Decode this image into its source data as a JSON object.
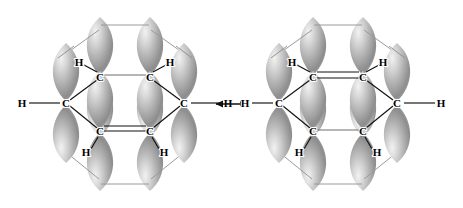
{
  "figure": {
    "background_color": "#ffffff",
    "ink_color": "#000000",
    "lobe_color_dark": "#8e8e8e",
    "lobe_color_mid": "#a8a8a8",
    "lobe_color_light": "#e2e2e2",
    "thin_bond_color": "#9a9a9a"
  },
  "resonance_arrow": {
    "symbol": "double-headed-arrow",
    "glyph": "↔",
    "label": "resonance"
  },
  "structures": [
    {
      "id": "kekule-left",
      "name": "Kekule structure A",
      "double_bond_positions": [
        "bottom",
        "upper-left",
        "upper-right"
      ],
      "single_bond_positions": [
        "top",
        "lower-left",
        "lower-right"
      ],
      "atoms": [
        {
          "id": "c1",
          "element": "C",
          "label": "C",
          "x": 66,
          "y": 103,
          "position": "left-vertex"
        },
        {
          "id": "c2",
          "element": "C",
          "label": "C",
          "x": 100,
          "y": 77,
          "position": "upper-left-vertex"
        },
        {
          "id": "c3",
          "element": "C",
          "label": "C",
          "x": 150,
          "y": 77,
          "position": "upper-right-vertex"
        },
        {
          "id": "c4",
          "element": "C",
          "label": "C",
          "x": 184,
          "y": 103,
          "position": "right-vertex"
        },
        {
          "id": "c5",
          "element": "C",
          "label": "C",
          "x": 150,
          "y": 131,
          "position": "lower-right-vertex"
        },
        {
          "id": "c6",
          "element": "C",
          "label": "C",
          "x": 100,
          "y": 131,
          "position": "lower-left-vertex"
        },
        {
          "id": "h1",
          "element": "H",
          "label": "H",
          "x": 22,
          "y": 103,
          "position": "left-outer"
        },
        {
          "id": "h2",
          "element": "H",
          "label": "H",
          "x": 79,
          "y": 62,
          "position": "upper-left-inner"
        },
        {
          "id": "h3",
          "element": "H",
          "label": "H",
          "x": 170,
          "y": 62,
          "position": "upper-right-inner"
        },
        {
          "id": "h4",
          "element": "H",
          "label": "H",
          "x": 228,
          "y": 103,
          "position": "right-outer"
        },
        {
          "id": "h5",
          "element": "H",
          "label": "H",
          "x": 86,
          "y": 152,
          "position": "lower-left-inner"
        },
        {
          "id": "h6",
          "element": "H",
          "label": "H",
          "x": 164,
          "y": 152,
          "position": "lower-right-inner"
        }
      ]
    },
    {
      "id": "kekule-right",
      "name": "Kekule structure B",
      "double_bond_positions": [
        "top",
        "lower-left",
        "lower-right"
      ],
      "single_bond_positions": [
        "bottom",
        "upper-left",
        "upper-right"
      ],
      "atoms": [
        {
          "id": "c1",
          "element": "C",
          "label": "C",
          "x": 279,
          "y": 103,
          "position": "left-vertex"
        },
        {
          "id": "c2",
          "element": "C",
          "label": "C",
          "x": 313,
          "y": 77,
          "position": "upper-left-vertex"
        },
        {
          "id": "c3",
          "element": "C",
          "label": "C",
          "x": 363,
          "y": 77,
          "position": "upper-right-vertex"
        },
        {
          "id": "c4",
          "element": "C",
          "label": "C",
          "x": 397,
          "y": 103,
          "position": "right-vertex"
        },
        {
          "id": "c5",
          "element": "C",
          "label": "C",
          "x": 363,
          "y": 131,
          "position": "lower-right-vertex"
        },
        {
          "id": "c6",
          "element": "C",
          "label": "C",
          "x": 313,
          "y": 131,
          "position": "lower-left-vertex"
        },
        {
          "id": "h1",
          "element": "H",
          "label": "H",
          "x": 245,
          "y": 103,
          "position": "left-outer"
        },
        {
          "id": "h2",
          "element": "H",
          "label": "H",
          "x": 292,
          "y": 62,
          "position": "upper-left-inner"
        },
        {
          "id": "h3",
          "element": "H",
          "label": "H",
          "x": 383,
          "y": 62,
          "position": "upper-right-inner"
        },
        {
          "id": "h4",
          "element": "H",
          "label": "H",
          "x": 441,
          "y": 103,
          "position": "right-outer"
        },
        {
          "id": "h5",
          "element": "H",
          "label": "H",
          "x": 299,
          "y": 152,
          "position": "lower-left-inner"
        },
        {
          "id": "h6",
          "element": "H",
          "label": "H",
          "x": 377,
          "y": 152,
          "position": "lower-right-inner"
        }
      ]
    }
  ],
  "orbitals": {
    "type": "p-orbital",
    "description": "vertical p orbital with two teardrop lobes above and below each carbon",
    "count_per_structure": 6
  }
}
